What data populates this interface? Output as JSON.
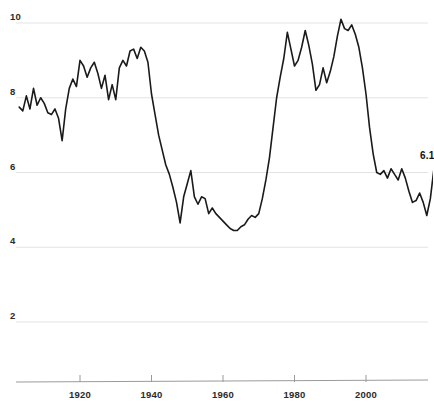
{
  "chart_data": {
    "type": "line",
    "title": "",
    "subtitle": "",
    "xlabel": "",
    "ylabel": "",
    "xlim": [
      1903,
      2020
    ],
    "ylim": [
      0,
      10.6
    ],
    "grid": true,
    "legend": null,
    "y_ticks": [
      10,
      8,
      6,
      4,
      2
    ],
    "x_ticks": [
      1920,
      1940,
      1960,
      1980,
      2000
    ],
    "annotations": [
      {
        "text": "6.1",
        "x": 2019,
        "y": 6.1
      }
    ],
    "series": [
      {
        "name": "rate",
        "color": "#1a1a1a",
        "x": [
          1903,
          1904,
          1905,
          1906,
          1907,
          1908,
          1909,
          1910,
          1911,
          1912,
          1913,
          1914,
          1915,
          1916,
          1917,
          1918,
          1919,
          1920,
          1921,
          1922,
          1923,
          1924,
          1925,
          1926,
          1927,
          1928,
          1929,
          1930,
          1931,
          1932,
          1933,
          1934,
          1935,
          1936,
          1937,
          1938,
          1939,
          1940,
          1941,
          1942,
          1943,
          1944,
          1945,
          1946,
          1947,
          1948,
          1949,
          1950,
          1951,
          1952,
          1953,
          1954,
          1955,
          1956,
          1957,
          1958,
          1959,
          1960,
          1961,
          1962,
          1963,
          1964,
          1965,
          1966,
          1967,
          1968,
          1969,
          1970,
          1971,
          1972,
          1973,
          1974,
          1975,
          1976,
          1977,
          1978,
          1979,
          1980,
          1981,
          1982,
          1983,
          1984,
          1985,
          1986,
          1987,
          1988,
          1989,
          1990,
          1991,
          1992,
          1993,
          1994,
          1995,
          1996,
          1997,
          1998,
          1999,
          2000,
          2001,
          2002,
          2003,
          2004,
          2005,
          2006,
          2007,
          2008,
          2009,
          2010,
          2011,
          2012,
          2013,
          2014,
          2015,
          2016,
          2017,
          2018,
          2019
        ],
        "y": [
          7.75,
          7.65,
          8.05,
          7.7,
          8.25,
          7.8,
          8.0,
          7.85,
          7.6,
          7.55,
          7.7,
          7.45,
          6.85,
          7.7,
          8.25,
          8.5,
          8.3,
          9.0,
          8.85,
          8.55,
          8.8,
          8.95,
          8.65,
          8.25,
          8.6,
          7.95,
          8.35,
          7.95,
          8.8,
          9.0,
          8.85,
          9.25,
          9.3,
          9.05,
          9.35,
          9.25,
          8.95,
          8.1,
          7.55,
          7.0,
          6.6,
          6.2,
          5.95,
          5.6,
          5.2,
          4.65,
          5.35,
          5.7,
          6.05,
          5.35,
          5.15,
          5.35,
          5.3,
          4.9,
          5.05,
          4.9,
          4.8,
          4.7,
          4.6,
          4.5,
          4.45,
          4.45,
          4.55,
          4.6,
          4.75,
          4.85,
          4.8,
          4.9,
          5.3,
          5.8,
          6.4,
          7.2,
          8.0,
          8.55,
          9.05,
          9.75,
          9.3,
          8.85,
          9.0,
          9.35,
          9.8,
          9.4,
          8.9,
          8.2,
          8.35,
          8.8,
          8.4,
          8.7,
          9.1,
          9.65,
          10.1,
          9.85,
          9.8,
          9.95,
          9.7,
          9.35,
          8.8,
          8.1,
          7.2,
          6.5,
          6.0,
          5.95,
          6.05,
          5.85,
          6.1,
          5.95,
          5.8,
          6.1,
          5.85,
          5.5,
          5.2,
          5.25,
          5.45,
          5.2,
          4.85,
          5.3,
          6.1
        ]
      }
    ]
  },
  "axis": {
    "y_ticks": [
      {
        "label": "10",
        "value": 10
      },
      {
        "label": "8",
        "value": 8
      },
      {
        "label": "6",
        "value": 6
      },
      {
        "label": "4",
        "value": 4
      },
      {
        "label": "2",
        "value": 2
      }
    ],
    "x_ticks": [
      {
        "label": "1920",
        "value": 1920
      },
      {
        "label": "1940",
        "value": 1940
      },
      {
        "label": "1960",
        "value": 1960
      },
      {
        "label": "1980",
        "value": 1980
      },
      {
        "label": "2000",
        "value": 2000
      }
    ]
  },
  "labels": {
    "end_value": "6.1"
  },
  "colors": {
    "line": "#1a1a1a",
    "grid": "#e3e3e3",
    "axis": "#9a9a9a",
    "text": "#2b2b2b",
    "background": "#ffffff"
  }
}
